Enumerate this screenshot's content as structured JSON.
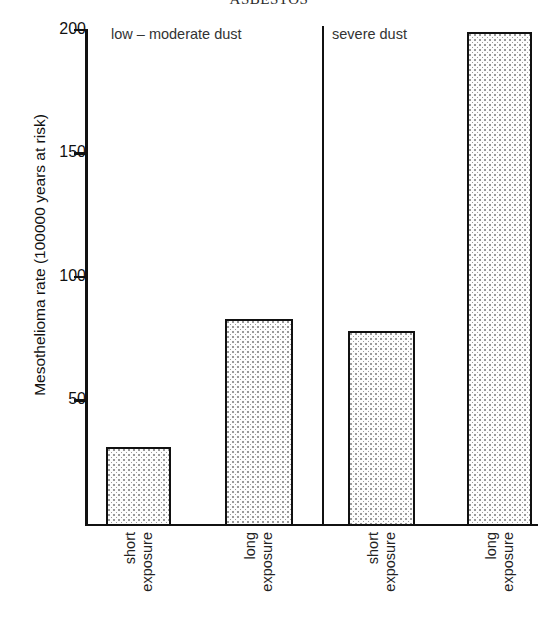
{
  "chart_data": {
    "type": "bar",
    "title": "ASBESTOS",
    "xlabel": "",
    "ylabel": "Mesothelioma rate (100000 years at risk)",
    "ylim": [
      0,
      200
    ],
    "yticks": [
      0,
      50,
      100,
      150,
      200
    ],
    "ytick_labels": [
      "",
      "50",
      "100",
      "150",
      "200"
    ],
    "grid": false,
    "legend": "none",
    "panels": [
      {
        "label": "low – moderate dust",
        "categories": [
          "short exposure",
          "long exposure"
        ],
        "values": [
          31,
          83
        ]
      },
      {
        "label": "severe dust",
        "categories": [
          "short exposure",
          "long exposure"
        ],
        "values": [
          78,
          199
        ]
      }
    ],
    "categories": [
      "short exposure",
      "long exposure",
      "short exposure",
      "long exposure"
    ],
    "values": [
      31,
      83,
      78,
      199
    ],
    "bar_fill": "stipple-dot",
    "bar_edge_color": "#111111",
    "bar_fill_color": "#9a9a9a"
  },
  "axis": {
    "ticks": [
      {
        "value": 200,
        "label": "200"
      },
      {
        "value": 150,
        "label": "150"
      },
      {
        "value": 100,
        "label": "100"
      },
      {
        "value": 50,
        "label": "50"
      }
    ],
    "title": "Mesothelioma rate (100000 years at risk)"
  },
  "panels": [
    {
      "label": "low – moderate dust"
    },
    {
      "label": "severe dust"
    }
  ],
  "bars": [
    {
      "category_line1": "short",
      "category_line2": "exposure",
      "value": 31
    },
    {
      "category_line1": "long",
      "category_line2": "exposure",
      "value": 83
    },
    {
      "category_line1": "short",
      "category_line2": "exposure",
      "value": 78
    },
    {
      "category_line1": "long",
      "category_line2": "exposure",
      "value": 199
    }
  ],
  "title": "ASBESTOS"
}
